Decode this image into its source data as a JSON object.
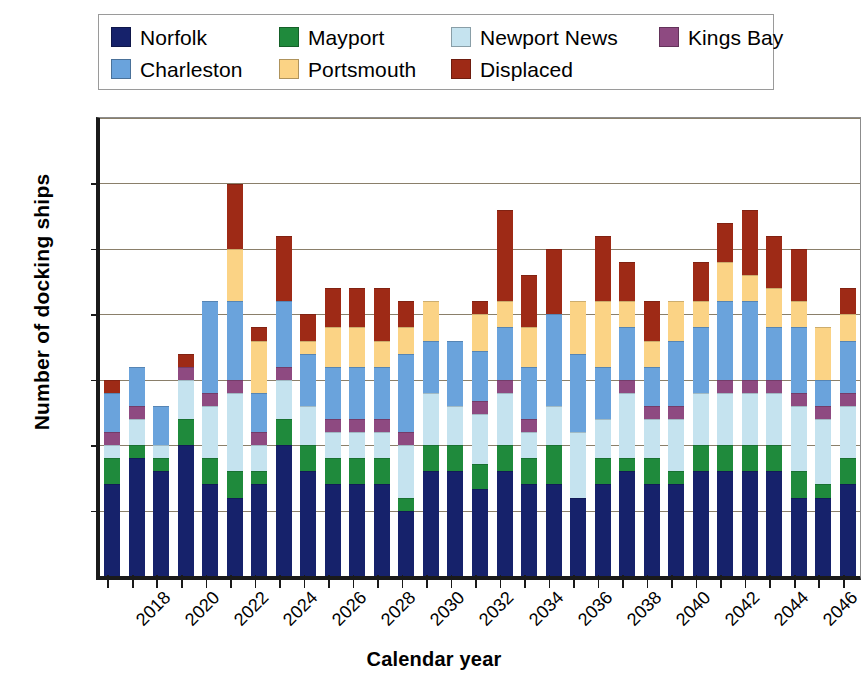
{
  "legend": {
    "rows": [
      [
        {
          "label": "Norfolk",
          "color": "#16226b"
        },
        {
          "label": "Mayport",
          "color": "#1f8a3c"
        },
        {
          "label": "Newport News",
          "color": "#c5e3ef"
        },
        {
          "label": "Kings Bay",
          "color": "#8e4a81"
        }
      ],
      [
        {
          "label": "Charleston",
          "color": "#6aa3dc"
        },
        {
          "label": "Portsmouth",
          "color": "#fbd385"
        },
        {
          "label": "Displaced",
          "color": "#9e2a16"
        }
      ]
    ]
  },
  "chart_data": {
    "type": "bar",
    "subtype": "stacked-vertical",
    "title": "",
    "xlabel": "Calendar year",
    "ylabel": "Number of docking ships",
    "ylim": [
      0,
      35
    ],
    "yticks": [
      0,
      5,
      10,
      15,
      20,
      25,
      30,
      35
    ],
    "grid": true,
    "legend_position": "top",
    "xtick_label_every": 2,
    "xtick_label_rotation": -45,
    "categories": [
      "2018",
      "2019",
      "2020",
      "2021",
      "2022",
      "2023",
      "2024",
      "2025",
      "2026",
      "2027",
      "2028",
      "2029",
      "2030",
      "2031",
      "2032",
      "2033",
      "2034",
      "2035",
      "2036",
      "2037",
      "2038",
      "2039",
      "2040",
      "2041",
      "2042",
      "2043",
      "2044",
      "2045",
      "2046",
      "2047",
      "2048"
    ],
    "series": [
      {
        "name": "Norfolk",
        "color": "#16226b",
        "values": [
          7,
          9,
          8,
          10,
          7,
          6,
          7,
          10,
          8,
          7,
          7,
          7,
          5,
          8,
          8,
          7,
          8,
          7,
          7,
          6,
          7,
          8,
          7,
          7,
          8,
          8,
          8,
          8,
          6,
          6,
          7
        ]
      },
      {
        "name": "Mayport",
        "color": "#1f8a3c",
        "values": [
          2,
          1,
          1,
          2,
          2,
          2,
          1,
          2,
          2,
          2,
          2,
          2,
          1,
          2,
          2,
          2,
          2,
          2,
          3,
          0,
          2,
          1,
          2,
          1,
          2,
          2,
          2,
          2,
          2,
          1,
          2
        ]
      },
      {
        "name": "Newport News",
        "color": "#c5e3ef",
        "values": [
          1,
          2,
          1,
          3,
          4,
          6,
          2,
          3,
          3,
          2,
          2,
          2,
          4,
          4,
          3,
          4,
          4,
          2,
          3,
          5,
          3,
          5,
          3,
          4,
          4,
          4,
          4,
          4,
          5,
          5,
          4
        ]
      },
      {
        "name": "Kings Bay",
        "color": "#8e4a81",
        "values": [
          1,
          1,
          0,
          1,
          1,
          1,
          1,
          1,
          0,
          1,
          1,
          1,
          1,
          0,
          0,
          1,
          1,
          1,
          0,
          0,
          0,
          1,
          1,
          1,
          0,
          1,
          1,
          1,
          1,
          1,
          1
        ]
      },
      {
        "name": "Charleston",
        "color": "#6aa3dc",
        "values": [
          3,
          3,
          3,
          0,
          7,
          6,
          3,
          5,
          4,
          4,
          4,
          4,
          6,
          4,
          5,
          4,
          4,
          4,
          7,
          6,
          4,
          4,
          3,
          5,
          5,
          6,
          6,
          4,
          5,
          2,
          4
        ]
      },
      {
        "name": "Portsmouth",
        "color": "#fbd385",
        "values": [
          0,
          0,
          0,
          0,
          0,
          4,
          4,
          0,
          1,
          3,
          3,
          2,
          2,
          3,
          0,
          3,
          2,
          3,
          0,
          4,
          5,
          2,
          2,
          3,
          2,
          3,
          2,
          3,
          2,
          4,
          2
        ]
      },
      {
        "name": "Displaced",
        "color": "#9e2a16",
        "values": [
          1,
          0,
          0,
          1,
          0,
          5,
          1,
          5,
          2,
          3,
          3,
          4,
          2,
          0,
          0,
          1,
          7,
          4,
          5,
          0,
          5,
          3,
          3,
          0,
          3,
          3,
          5,
          4,
          4,
          0,
          2
        ]
      }
    ],
    "totals": [
      15,
      16,
      13,
      17,
      21,
      30,
      19,
      26,
      20,
      22,
      22,
      22,
      21,
      21,
      18,
      21,
      28,
      23,
      26,
      21,
      26,
      24,
      21,
      21,
      24,
      27,
      28,
      26,
      25,
      19,
      22
    ]
  }
}
